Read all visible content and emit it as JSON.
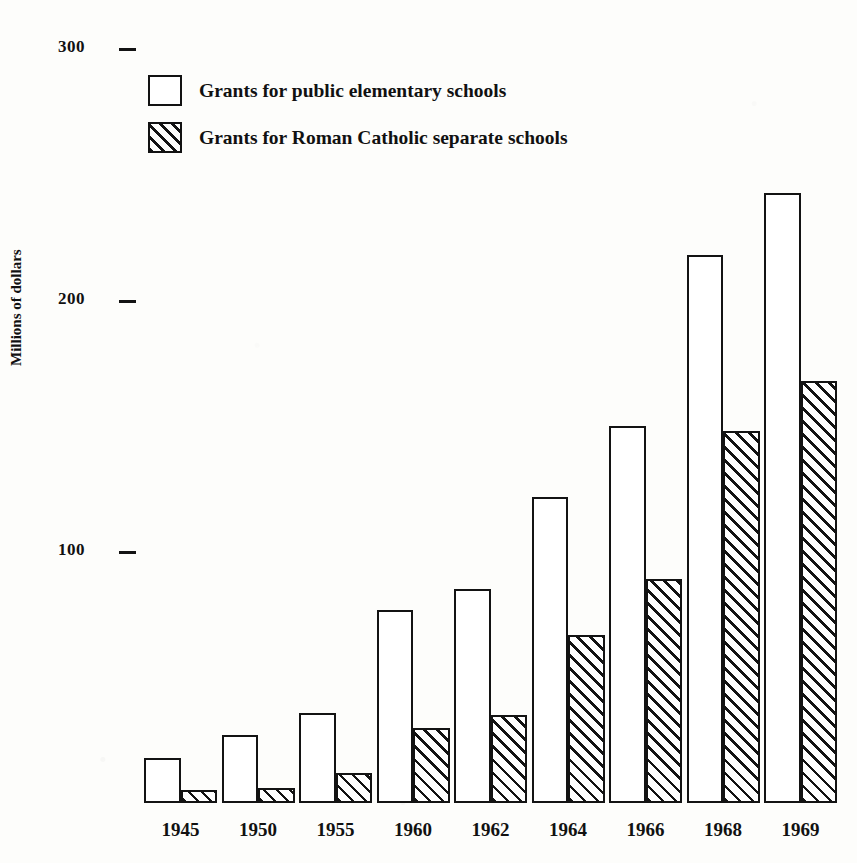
{
  "chart_data": {
    "type": "bar",
    "title": "",
    "subtitle": "",
    "xlabel": "",
    "ylabel": "Millions of dollars",
    "categories": [
      "1945",
      "1950",
      "1955",
      "1960",
      "1962",
      "1964",
      "1966",
      "1968",
      "1969"
    ],
    "series": [
      {
        "name": "Grants for public elementary schools",
        "pattern": "solid-white",
        "values": [
          18,
          27,
          36,
          77,
          85,
          122,
          150,
          218,
          243
        ]
      },
      {
        "name": "Grants for Roman Catholic separate schools",
        "pattern": "diagonal-hatch",
        "values": [
          5,
          6,
          12,
          30,
          35,
          67,
          89,
          148,
          168
        ]
      }
    ],
    "ylim": [
      0,
      310
    ],
    "yticks": [
      100,
      200,
      300
    ],
    "ytick_labels": [
      "100",
      "200",
      "300"
    ],
    "grid": false,
    "legend_position": "top-left-inside",
    "axis_style": "tick-dashes-only-no-axis-lines"
  },
  "legend": {
    "items": [
      {
        "label": "Grants for public elementary schools",
        "swatch": "white-square"
      },
      {
        "label": "Grants for Roman Catholic separate schools",
        "swatch": "hatched-square"
      }
    ]
  },
  "colors": {
    "ink": "#131313",
    "paper": "#fdfdfb",
    "bar_fill": "#ffffff"
  }
}
